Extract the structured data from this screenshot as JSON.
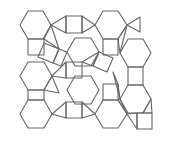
{
  "diagram": {
    "type": "tiling",
    "colors": {
      "background": "#ffffff",
      "stroke": "#666666"
    },
    "size": {
      "width": 176,
      "height": 144
    },
    "polygons": [
      {
        "kind": "hexagon",
        "points": "28,11 43,11 51,25 43,39 28,39 20,25"
      },
      {
        "kind": "hexagon",
        "points": "28,62 44,62 52,76 44,90 28,90 20,76"
      },
      {
        "kind": "hexagon",
        "points": "28,100 44,100 52,114 44,128 28,128 20,114"
      },
      {
        "kind": "hexagon",
        "points": "75,38 91,38 99,52 91,66 75,66 67,52"
      },
      {
        "kind": "hexagon",
        "points": "75,76 91,76 99,90 91,104 75,104 67,90"
      },
      {
        "kind": "hexagon",
        "points": "103,11 118,11 127,25 118,39 103,39 95,25"
      },
      {
        "kind": "hexagon",
        "points": "128,39 143,39 151,53 143,67 128,67 120,53"
      },
      {
        "kind": "hexagon",
        "points": "128,85 143,85 151,99 143,113 128,113 120,99"
      },
      {
        "kind": "hexagon",
        "points": "103,100 118,100 127,114 118,128 103,128 95,114"
      },
      {
        "kind": "square",
        "points": "66,16 82,16 82,33 66,33"
      },
      {
        "kind": "square",
        "points": "28,39 44,39 44,55 28,55"
      },
      {
        "kind": "square",
        "points": "44,43 59,49 53,63 38,57"
      },
      {
        "kind": "square",
        "points": "59,49 67,52 61,66 53,63"
      },
      {
        "kind": "square",
        "points": "66,62 82,62 82,78 66,78"
      },
      {
        "kind": "square",
        "points": "28,90 44,90 44,100 28,100"
      },
      {
        "kind": "square",
        "points": "66,102 82,102 82,118 66,118"
      },
      {
        "kind": "square",
        "points": "103,39 118,39 118,55 103,55"
      },
      {
        "kind": "square",
        "points": "128,67 143,67 143,85 128,85"
      },
      {
        "kind": "square",
        "points": "103,84 118,84 118,100 103,100"
      },
      {
        "kind": "square",
        "points": "99,52 113,58 107,72 93,66"
      },
      {
        "kind": "square",
        "points": "137,113 152,113 152,129 137,129"
      },
      {
        "kind": "triangle",
        "points": "51,25 66,16 66,33"
      },
      {
        "kind": "triangle",
        "points": "82,16 95,25 82,33"
      },
      {
        "kind": "triangle",
        "points": "127,25 140,17 140,32"
      },
      {
        "kind": "triangle",
        "points": "44,39 51,25 59,49"
      },
      {
        "kind": "triangle",
        "points": "52,76 66,62 66,78"
      },
      {
        "kind": "triangle",
        "points": "44,90 52,76 59,93"
      },
      {
        "kind": "triangle",
        "points": "52,114 66,102 66,118"
      },
      {
        "kind": "triangle",
        "points": "82,62 99,52 93,66"
      },
      {
        "kind": "triangle",
        "points": "82,102 95,114 82,118"
      },
      {
        "kind": "triangle",
        "points": "118,39 127,25 120,53"
      },
      {
        "kind": "triangle",
        "points": "118,84 120,99 113,72"
      },
      {
        "kind": "triangle",
        "points": "127,114 137,113 137,129"
      },
      {
        "kind": "triangle",
        "points": "120,99 127,114 118,100"
      },
      {
        "kind": "triangle",
        "points": "143,113 151,99 152,113"
      }
    ]
  }
}
